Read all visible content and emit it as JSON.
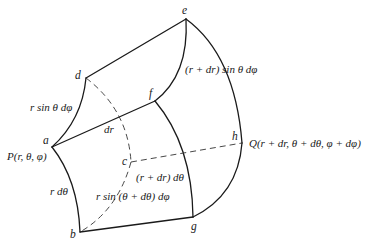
{
  "figure": {
    "vertices": {
      "a": "a",
      "b": "b",
      "c": "c",
      "d": "d",
      "e": "e",
      "f": "f",
      "g": "g",
      "h": "h"
    },
    "points": {
      "P": "P(r, θ, φ)",
      "Q": "Q(r + dr, θ + dθ, φ + dφ)"
    },
    "edge_labels": {
      "ad": "r sin θ dφ",
      "ef": "(r + dr) sin θ dφ",
      "af": "dr",
      "ab": "r dθ",
      "ch": "(r + dr) dθ",
      "bc": "r sin (θ + dθ)  dφ"
    },
    "colors": {
      "stroke": "#1a1a1a",
      "background": "#ffffff"
    }
  }
}
